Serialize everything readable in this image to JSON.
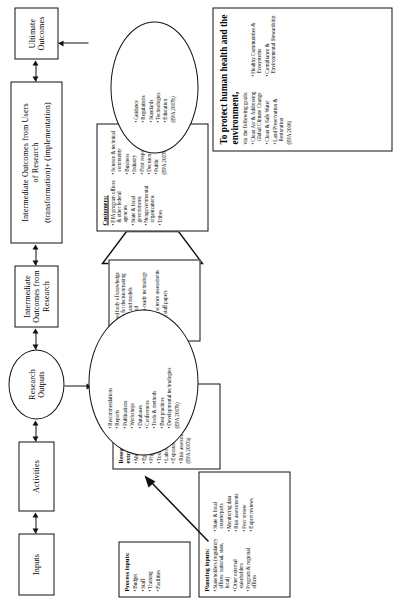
{
  "stages": [
    {
      "id": "inputs",
      "label": "Inputs"
    },
    {
      "id": "activities",
      "label": "Activities"
    },
    {
      "id": "research-outputs",
      "line1": "Research",
      "line2": "Outputs"
    },
    {
      "id": "intermediate-outcomes-research",
      "line1": "Intermediate",
      "line2": "Outcomes from",
      "line3": "Research"
    },
    {
      "id": "intermediate-outcomes-users",
      "line1": "Intermediate Outcomes from Users",
      "line2": "of Research",
      "line3": "(transformation)+ (implementation)"
    },
    {
      "id": "ultimate-outcomes",
      "line1": "Ultimate",
      "line2": "Outcomes"
    }
  ],
  "process_inputs": {
    "heading": "Process inputs:",
    "items": [
      "Budget",
      "Staff",
      "Training",
      "Facilities"
    ]
  },
  "planning_inputs": {
    "heading": "Planning inputs:",
    "items": [
      "Stakeholders (regulatory offices: national, state, local)",
      "Other external stakeholders",
      "Program & regional offices",
      "State & local counterparts",
      "Monitoring data",
      "Risk assessments",
      "Peer review",
      "Expert reviews"
    ]
  },
  "research_activities": {
    "heading": "Research (intramural and extramural):",
    "items": [
      "Monitoring",
      "Epidemiologic studies",
      "Physical studies",
      "Toxicologic studies",
      "Laboratory & field studies",
      "Exposure measurements",
      "Risk assessment"
    ],
    "citation": "(EPA 2007a)"
  },
  "research_outputs": {
    "items": [
      "Recommendations",
      "Reports",
      "Publications",
      "Workshops",
      "Databases",
      "Conferences",
      "Tools & methods",
      "Best practices",
      "Developmental technologies"
    ],
    "citation": "(EPA 2007b)"
  },
  "intermediate_outcomes_research": {
    "items": [
      "Improved body of knowledge available for decisionmaking",
      "New tools and models disseminated",
      "Application-ready technology provided",
      "Integrated science assessments",
      "Program staff papers"
    ]
  },
  "customers": {
    "heading": "Customers:",
    "items": [
      "EPA program offices & other federal agencies",
      "State & local governments",
      "Nongovernmental organizations",
      "Tribes",
      "Science & technical community",
      "Business",
      "Industry",
      "First responders",
      "Decision-makers",
      "Public"
    ],
    "citation": "(EPA 2007b)"
  },
  "user_outcomes": {
    "items": [
      "Guidance",
      "Regulations",
      "Standards",
      "Technologies",
      "Education"
    ],
    "citation": "(EPA 2007b)"
  },
  "goals": {
    "headline": "To protect human health and the environment,",
    "subline": "via the following goals:",
    "items": [
      "Clean Air & Addressing Global Climate Change",
      "Clean & Safe Water",
      "Land Preservation & Restoration",
      "Healthy Communities & Ecosystems",
      "Compliance & Environmental Stewardship"
    ],
    "citation": "(EPA 2006)"
  },
  "colors": {
    "ink": "#111111",
    "paper": "#ffffff"
  }
}
